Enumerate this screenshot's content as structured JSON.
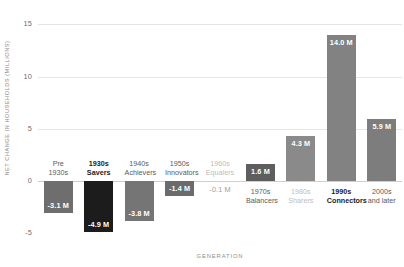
{
  "chart_data": {
    "type": "bar",
    "title": "",
    "subtitle": "",
    "xlabel": "GENERATION",
    "ylabel": "NET CHANGE IN HOUSEHOLDS (MILLIONS)",
    "ylim": [
      -6.5,
      15.8
    ],
    "yticks": [
      15,
      10,
      5,
      0,
      -5
    ],
    "ytick_labels": [
      "15",
      "10",
      "5",
      "0",
      "-5"
    ],
    "grid": true,
    "legend": "none",
    "categories": [
      "Pre 1930s",
      "1930s Savers",
      "1940s Achievers",
      "1950s Innovators",
      "1960s Equalers",
      "1970s Balancers",
      "1980s Sharers",
      "1990s Connectors",
      "2000s and later"
    ],
    "values": [
      -3.1,
      -4.9,
      -3.8,
      -1.4,
      -0.1,
      1.6,
      4.3,
      14.0,
      5.9
    ],
    "data_labels": [
      "-3.1 M",
      "-4.9 M",
      "-3.8 M",
      "-1.4 M",
      "-0.1 M",
      "1.6 M",
      "4.3 M",
      "14.0 M",
      "5.9 M"
    ],
    "bars": [
      {
        "category_line1": "Pre",
        "category_line2": "1930s",
        "value": -3.1,
        "label": "-3.1 M",
        "color": "#6e6e6e",
        "emphasis": "normal"
      },
      {
        "category_line1": "1930s",
        "category_line2": "Savers",
        "value": -4.9,
        "label": "-4.9 M",
        "color": "#1c1c1c",
        "emphasis": "bold"
      },
      {
        "category_line1": "1940s",
        "category_line2": "Achievers",
        "value": -3.8,
        "label": "-3.8 M",
        "color": "#757575",
        "emphasis": "normal"
      },
      {
        "category_line1": "1950s",
        "category_line2": "Innovators",
        "value": -1.4,
        "label": "-1.4 M",
        "color": "#6b6b6b",
        "emphasis": "normal"
      },
      {
        "category_line1": "1960s",
        "category_line2": "Equalers",
        "value": -0.1,
        "label": "-0.1 M",
        "color": "#e0e0e0",
        "emphasis": "faded"
      },
      {
        "category_line1": "1970s",
        "category_line2": "Balancers",
        "value": 1.6,
        "label": "1.6 M",
        "color": "#5e5e5e",
        "emphasis": "normal"
      },
      {
        "category_line1": "1980s",
        "category_line2": "Sharers",
        "value": 4.3,
        "label": "4.3 M",
        "color": "#8a8a8a",
        "emphasis": "faded"
      },
      {
        "category_line1": "1990s",
        "category_line2": "Connectors",
        "value": 14.0,
        "label": "14.0 M",
        "color": "#828282",
        "emphasis": "bold"
      },
      {
        "category_line1": "2000s",
        "category_line2": "and later",
        "value": 5.9,
        "label": "5.9 M",
        "color": "#7d7d7d",
        "emphasis": "normal"
      }
    ],
    "colors": {
      "bar_default": "#7a7a7a",
      "bar_highlight": "#1c1c1c",
      "bar_faded": "#e0e0e0",
      "gridline": "#e6e6e6",
      "zero_line": "#cfcfcf",
      "axis_text": "#6f6f6f",
      "title_text": "#8c8c8c"
    }
  }
}
